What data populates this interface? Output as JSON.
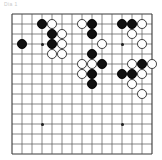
{
  "caption": {
    "text": "Dia 1"
  },
  "board": {
    "name": "go-board",
    "cols": 15,
    "rows": 15,
    "origin_x": 12,
    "origin_y": 6,
    "spacing": 10,
    "stone_radius": 4.9,
    "line_color": "#555555",
    "edge_color": "#3a3a3a",
    "black_color": "#111111",
    "white_color": "#ffffff",
    "white_edge_color": "#3a3a3a",
    "background": "#ffffff",
    "hoshi": [
      {
        "col": 4,
        "row": 4
      },
      {
        "col": 4,
        "row": 12
      },
      {
        "col": 12,
        "row": 4
      },
      {
        "col": 12,
        "row": 12
      }
    ],
    "stones": [
      {
        "color": "black",
        "col": 4,
        "row": 2
      },
      {
        "color": "white",
        "col": 5,
        "row": 2
      },
      {
        "color": "white",
        "col": 8,
        "row": 2
      },
      {
        "color": "black",
        "col": 9,
        "row": 2
      },
      {
        "color": "black",
        "col": 12,
        "row": 2
      },
      {
        "color": "black",
        "col": 13,
        "row": 2
      },
      {
        "color": "white",
        "col": 14,
        "row": 2
      },
      {
        "color": "black",
        "col": 5,
        "row": 3
      },
      {
        "color": "white",
        "col": 6,
        "row": 3
      },
      {
        "color": "black",
        "col": 9,
        "row": 3
      },
      {
        "color": "white",
        "col": 13,
        "row": 3
      },
      {
        "color": "black",
        "col": 2,
        "row": 4
      },
      {
        "color": "black",
        "col": 5,
        "row": 4
      },
      {
        "color": "white",
        "col": 6,
        "row": 4
      },
      {
        "color": "white",
        "col": 10,
        "row": 4
      },
      {
        "color": "white",
        "col": 14,
        "row": 4
      },
      {
        "color": "white",
        "col": 5,
        "row": 5
      },
      {
        "color": "white",
        "col": 6,
        "row": 5
      },
      {
        "color": "black",
        "col": 9,
        "row": 5
      },
      {
        "color": "white",
        "col": 8,
        "row": 6
      },
      {
        "color": "white",
        "col": 9,
        "row": 6
      },
      {
        "color": "black",
        "col": 10,
        "row": 6
      },
      {
        "color": "white",
        "col": 13,
        "row": 6
      },
      {
        "color": "black",
        "col": 14,
        "row": 6
      },
      {
        "color": "white",
        "col": 15,
        "row": 6
      },
      {
        "color": "white",
        "col": 8,
        "row": 7
      },
      {
        "color": "black",
        "col": 9,
        "row": 7
      },
      {
        "color": "black",
        "col": 12,
        "row": 7
      },
      {
        "color": "black",
        "col": 13,
        "row": 7
      },
      {
        "color": "white",
        "col": 14,
        "row": 7
      },
      {
        "color": "black",
        "col": 9,
        "row": 8
      },
      {
        "color": "white",
        "col": 13,
        "row": 8
      },
      {
        "color": "white",
        "col": 14,
        "row": 9
      }
    ]
  }
}
